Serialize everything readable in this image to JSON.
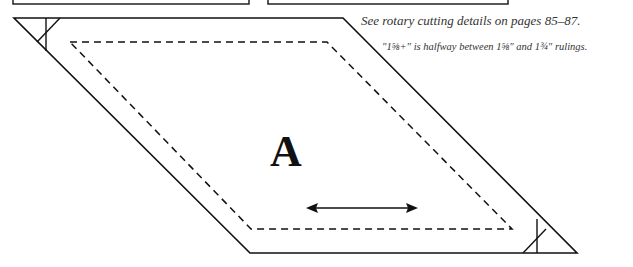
{
  "notes": {
    "rotary": "See rotary cutting details on pages 85–87.",
    "halfway": "\"1⅝+\" is halfway between 1⅝\" and 1¾\" rulings."
  },
  "pattern_piece": {
    "label": "A",
    "shape": "parallelogram",
    "cutting_line": "solid",
    "sewing_line": "dashed",
    "grain_line": "double-headed-arrow"
  },
  "colors": {
    "line": "#111111",
    "note_text": "#333333",
    "background": "#ffffff"
  }
}
